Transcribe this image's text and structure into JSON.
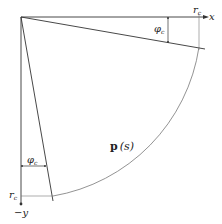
{
  "diagram": {
    "labels": {
      "x_axis": "x",
      "y_axis": "−y",
      "radius_x": "r",
      "radius_x_sub": "c",
      "radius_y": "r",
      "radius_y_sub": "c",
      "angle_top": "φ",
      "angle_top_sub": "c",
      "angle_left": "φ",
      "angle_left_sub": "c",
      "curve": "p",
      "curve_arg": "(s)"
    },
    "colors": {
      "line": "#333333",
      "arc": "#666666"
    }
  }
}
